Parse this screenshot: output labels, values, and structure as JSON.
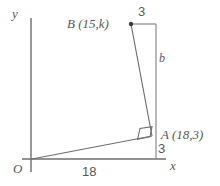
{
  "figure": {
    "background_color": "#ffffff",
    "stroke_color": "#6e6e70",
    "text_color": "#58585a",
    "axes": {
      "y_axis_label": "y",
      "x_axis_label": "x",
      "origin_label": "O"
    },
    "points": [
      {
        "name": "origin",
        "label": "O"
      },
      {
        "name": "point-a",
        "label": "A  (18,3)"
      },
      {
        "name": "point-b",
        "label": "B (15,k)"
      }
    ],
    "labels": {
      "point_b": "B (15,k)",
      "point_a": "A  (18,3)",
      "origin": "O",
      "side_b": "b",
      "top_segment": "3",
      "bottom_segment": "3",
      "base_segment": "18",
      "axis_x": "x",
      "axis_y": "y"
    },
    "annotations": {
      "right_angle_at": "A"
    }
  }
}
